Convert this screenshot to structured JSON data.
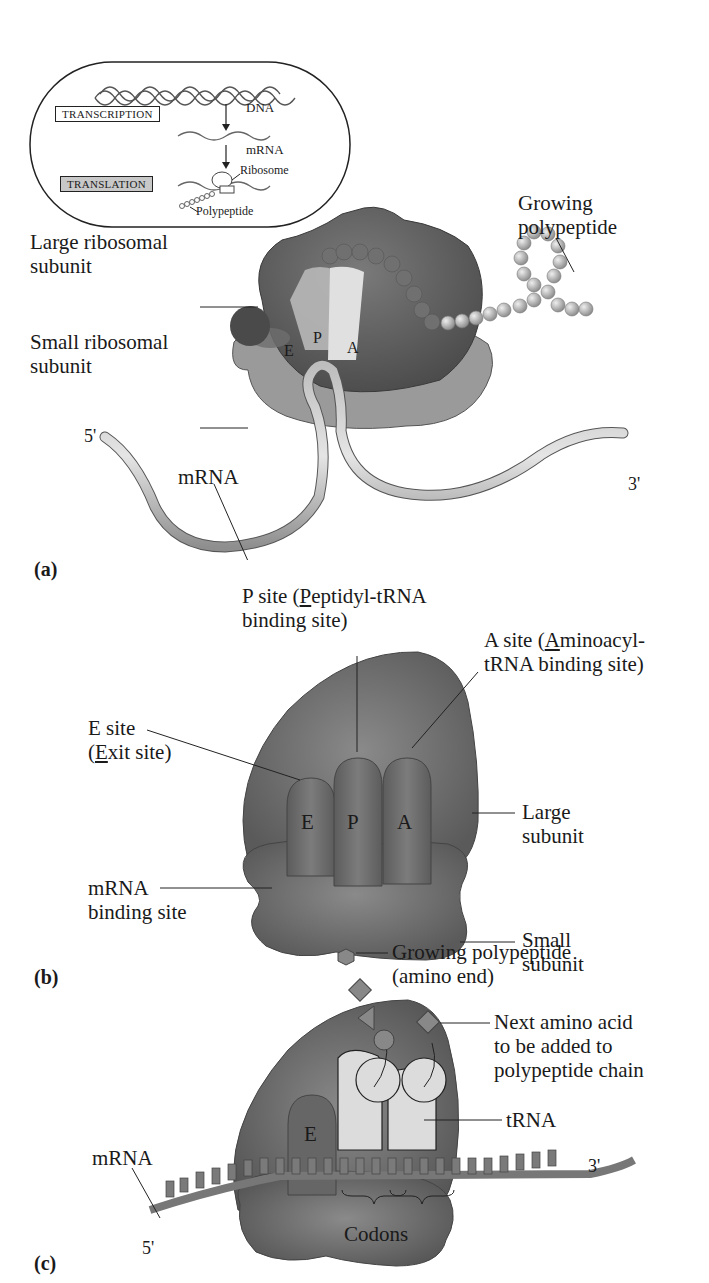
{
  "inset": {
    "steps": [
      "TRANSCRIPTION",
      "TRANSLATION"
    ],
    "labels": {
      "dna": "DNA",
      "mrna": "mRNA",
      "ribosome": "Ribosome",
      "polypeptide": "Polypeptide"
    }
  },
  "panel_a": {
    "letter": "(a)",
    "labels": {
      "large_subunit_1": "Large ribosomal",
      "large_subunit_2": "subunit",
      "small_subunit_1": "Small ribosomal",
      "small_subunit_2": "subunit",
      "growing_1": "Growing",
      "growing_2": "polypeptide",
      "mrna": "mRNA",
      "five_prime": "5'",
      "three_prime": "3'",
      "site_e": "E",
      "site_p": "P",
      "site_a": "A"
    }
  },
  "panel_b": {
    "letter": "(b)",
    "labels": {
      "p_site_1a": "P site (",
      "p_site_1u": "P",
      "p_site_1b": "eptidyl-tRNA",
      "p_site_2": "binding site)",
      "a_site_1a": "A site (",
      "a_site_1u": "A",
      "a_site_1b": "minoacyl-",
      "a_site_2": "tRNA binding site)",
      "e_site_1": "E site",
      "e_site_2a": "(",
      "e_site_2u": "E",
      "e_site_2b": "xit site)",
      "large_1": "Large",
      "large_2": "subunit",
      "small_1": "Small",
      "small_2": "subunit",
      "mrna_bind_1": "mRNA",
      "mrna_bind_2": "binding site",
      "site_e": "E",
      "site_p": "P",
      "site_a": "A"
    }
  },
  "panel_c": {
    "letter": "(c)",
    "labels": {
      "growing_1": "Growing polypeptide",
      "growing_2": "(amino end)",
      "next_1": "Next amino acid",
      "next_2": "to be added to",
      "next_3": "polypeptide chain",
      "trna": "tRNA",
      "mrna": "mRNA",
      "three_prime": "3'",
      "five_prime": "5'",
      "codons": "Codons",
      "site_e": "E"
    }
  }
}
